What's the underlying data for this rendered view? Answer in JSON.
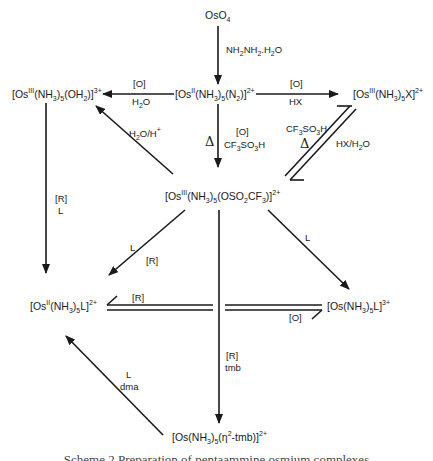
{
  "diagram": {
    "type": "reaction-scheme",
    "compounds": {
      "oso4": {
        "html": "OsO<sub>4</sub>",
        "text": "OsO4"
      },
      "dinitrogen": {
        "html": "[Os<sup>II</sup>(NH<sub>3</sub>)<sub>5</sub>(N<sub>2</sub>)]<sup>2+</sup>",
        "text": "[OsII(NH3)5(N2)]2+"
      },
      "aqua": {
        "html": "[Os<sup>III</sup>(NH<sub>3</sub>)<sub>5</sub>(OH<sub>2</sub>)]<sup>3+</sup>",
        "text": "[OsIII(NH3)5(OH2)]3+"
      },
      "halide": {
        "html": "[Os<sup>III</sup>(NH<sub>3</sub>)<sub>5</sub>X]<sup>2+</sup>",
        "text": "[OsIII(NH3)5X]2+"
      },
      "triflate": {
        "html": "[Os<sup>III</sup>(NH<sub>3</sub>)<sub>5</sub>(OSO<sub>2</sub>CF<sub>3</sub>)]<sup>2+</sup>",
        "text": "[OsIII(NH3)5(OSO2CF3)]2+"
      },
      "os2_l": {
        "html": "[Os<sup>II</sup>(NH<sub>3</sub>)<sub>5</sub>L]<sup>2+</sup>",
        "text": "[OsII(NH3)5L]2+"
      },
      "os3_l": {
        "html": "[Os(NH<sub>3</sub>)<sub>5</sub>L]<sup>3+</sup>",
        "text": "[Os(NH3)5L]3+"
      },
      "tmb": {
        "html": "[Os(NH<sub>3</sub>)<sub>5</sub>(η<sup>2</sup>-tmb)]<sup>2+</sup>",
        "text": "[Os(NH3)5(η2-tmb)]2+"
      }
    },
    "conditions": {
      "hydrazine": {
        "html": "NH<sub>2</sub>NH<sub>2</sub>.H<sub>2</sub>O",
        "text": "NH2NH2.H2O"
      },
      "to_aqua_top": "[O]",
      "to_aqua_bottom": {
        "html": "H<sub>2</sub>O",
        "text": "H2O"
      },
      "to_halide_top": "[O]",
      "to_halide_bottom": "HX",
      "triflate_delta": "Δ",
      "triflate_top": "[O]",
      "triflate_bottom": {
        "html": "CF<sub>3</sub>SO<sub>3</sub>H",
        "text": "CF3SO3H"
      },
      "hydrolysis": {
        "html": "H<sub>2</sub>O/H<sup>+</sup>",
        "text": "H2O/H+"
      },
      "halide_fwd": {
        "html": "CF<sub>3</sub>SO<sub>3</sub>H",
        "text": "CF3SO3H"
      },
      "halide_fwd_delta": "Δ",
      "halide_rev": {
        "html": "HX/H<sub>2</sub>O",
        "text": "HX/H2O"
      },
      "aqua_reduce_1": "[R]",
      "aqua_reduce_2": "L",
      "triflate_to_os2_1": "L",
      "triflate_to_os2_2": "[R]",
      "triflate_to_os3": "L",
      "redox_top": "[R]",
      "redox_bottom": "[O]",
      "tmb_1": "[R]",
      "tmb_2": "tmb",
      "dma_1": "L",
      "dma_2": "dma"
    },
    "caption": "Scheme 2  Preparation of pentaammine osmium complexes"
  }
}
